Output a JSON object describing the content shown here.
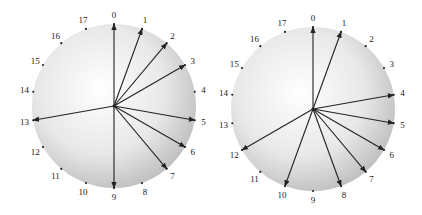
{
  "diagrams": [
    {
      "name": "left-circle",
      "cx": 114,
      "cy": 106,
      "r": 82,
      "positions": [
        "0",
        "1",
        "2",
        "3",
        "4",
        "5",
        "6",
        "7",
        "8",
        "9",
        "10",
        "11",
        "12",
        "13",
        "14",
        "15",
        "16",
        "17"
      ],
      "arrows": [
        0,
        1,
        2,
        3,
        5,
        6,
        7,
        9,
        13
      ]
    },
    {
      "name": "right-circle",
      "cx": 313,
      "cy": 109,
      "r": 82,
      "positions": [
        "0",
        "1",
        "2",
        "3",
        "4",
        "5",
        "6",
        "7",
        "8",
        "9",
        "10",
        "11",
        "12",
        "13",
        "14",
        "15",
        "16",
        "17"
      ],
      "arrows": [
        0,
        1,
        4,
        5,
        6,
        7,
        8,
        10,
        12
      ]
    }
  ],
  "colors": {
    "arrow": "#222222",
    "fill_center": "#ffffff",
    "fill_edge": "#bdbdbd"
  }
}
